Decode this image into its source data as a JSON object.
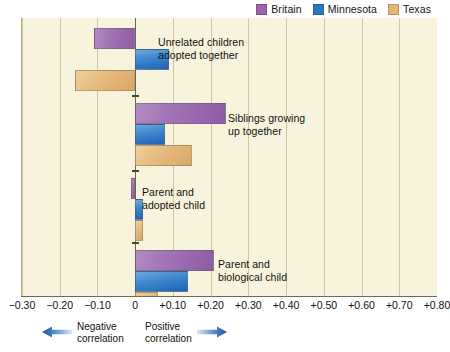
{
  "legend": {
    "entries": [
      {
        "label": "Britain",
        "color": "#9a63ad"
      },
      {
        "label": "Minnesota",
        "color": "#2d77c2"
      },
      {
        "label": "Texas",
        "color": "#e3b679"
      }
    ]
  },
  "axis": {
    "ticks": [
      "−0.30",
      "−0.20",
      "−0.10",
      "0",
      "+0.10",
      "+0.20",
      "+0.30",
      "+0.40",
      "+0.50",
      "+0.60",
      "+0.70",
      "+0.80"
    ],
    "tick_values": [
      -0.3,
      -0.2,
      -0.1,
      0,
      0.1,
      0.2,
      0.3,
      0.4,
      0.5,
      0.6,
      0.7,
      0.8
    ]
  },
  "footer": {
    "negative": {
      "label": "Negative\ncorrelation",
      "icon": "arrow-left-icon",
      "color": "#2d6fc4"
    },
    "positive": {
      "label": "Positive\ncorrelation",
      "icon": "arrow-right-icon",
      "color": "#2d6fc4"
    }
  },
  "groups": [
    {
      "label": "Unrelated children\nadopted together"
    },
    {
      "label": "Siblings growing\nup together"
    },
    {
      "label": "Parent and\nadopted child"
    },
    {
      "label": "Parent and\nbiological child"
    }
  ],
  "chart_data": {
    "type": "bar",
    "orientation": "horizontal",
    "title": "",
    "xlabel": "",
    "ylabel": "",
    "xlim": [
      -0.3,
      0.8
    ],
    "xticks": [
      -0.3,
      -0.2,
      -0.1,
      0,
      0.1,
      0.2,
      0.3,
      0.4,
      0.5,
      0.6,
      0.7,
      0.8
    ],
    "grid": true,
    "legend_position": "top-right",
    "categories": [
      "Unrelated children adopted together",
      "Siblings growing up together",
      "Parent and adopted child",
      "Parent and biological child"
    ],
    "series": [
      {
        "name": "Britain",
        "color": "#9a63ad",
        "values": [
          -0.11,
          0.24,
          -0.01,
          0.21
        ]
      },
      {
        "name": "Minnesota",
        "color": "#2d77c2",
        "values": [
          0.09,
          0.08,
          0.02,
          0.14
        ]
      },
      {
        "name": "Texas",
        "color": "#e3b679",
        "values": [
          -0.16,
          0.15,
          0.02,
          0.06
        ]
      }
    ],
    "annotations": [
      "Negative correlation",
      "Positive correlation"
    ]
  }
}
